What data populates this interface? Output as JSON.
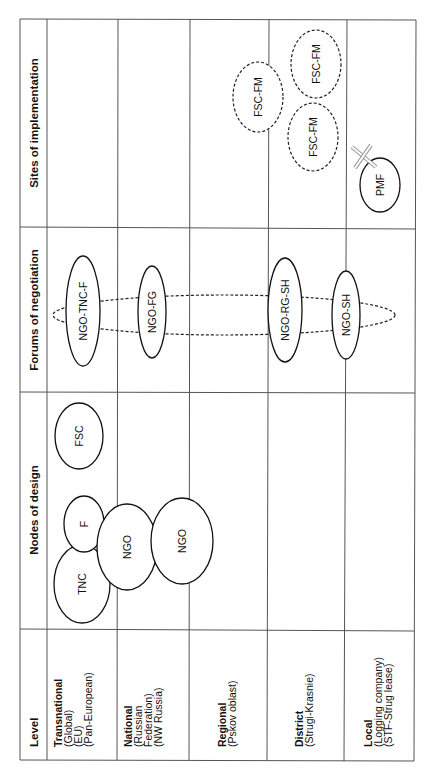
{
  "table": {
    "orientation": "rotated-90-ccw",
    "headers": {
      "level": "Level",
      "nodes_of_design": "Nodes of design",
      "forums_of_negotiation": "Forums of negotiation",
      "sites_of_implementation": "Sites of implementation"
    },
    "levels": [
      {
        "name": "Transnational",
        "details": [
          "(Global)",
          "(EU)",
          "(Pan-European)"
        ]
      },
      {
        "name": "National",
        "details": [
          "(Russian",
          "Federation)",
          "(NW Russia)"
        ]
      },
      {
        "name": "Regional",
        "details": [
          "(Pskov oblast)"
        ]
      },
      {
        "name": "District",
        "details": [
          "(Strugi-Krasnie)"
        ]
      },
      {
        "name": "Local",
        "details": [
          "(Logging company)",
          "(STF-Strug lease)"
        ]
      }
    ]
  },
  "nodes_of_design": [
    {
      "label": "TNC",
      "style": "solid",
      "level": "Transnational"
    },
    {
      "label": "F",
      "style": "solid",
      "level": "Transnational"
    },
    {
      "label": "FSC",
      "style": "solid",
      "level": "Transnational"
    },
    {
      "label": "NGO",
      "style": "solid",
      "level": "Transnational/National"
    },
    {
      "label": "NGO",
      "style": "solid",
      "level": "National/Regional"
    }
  ],
  "forums_of_negotiation": {
    "items": [
      {
        "label": "NGO-TNC-F",
        "style": "solid",
        "level": "Transnational"
      },
      {
        "label": "NGO-FG",
        "style": "solid",
        "level": "National"
      },
      {
        "label": "NGO-RG-SH",
        "style": "solid",
        "level": "District"
      },
      {
        "label": "NGO-SH",
        "style": "solid",
        "level": "District/Local"
      }
    ],
    "connector": "dashed ellipse linking all forums"
  },
  "sites_of_implementation": [
    {
      "label": "FSC-FM",
      "style": "dashed",
      "level": "Regional/District"
    },
    {
      "label": "FSC-FM",
      "style": "dashed",
      "level": "District"
    },
    {
      "label": "FSC-FM",
      "style": "dashed",
      "level": "District"
    },
    {
      "label": "PMF",
      "style": "solid",
      "level": "Local",
      "marker": "cross-icon"
    }
  ]
}
